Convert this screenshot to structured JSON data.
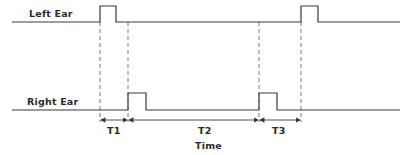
{
  "diagram": {
    "type": "timing-diagram",
    "signals": [
      {
        "name": "Left Ear",
        "baseline_y": 22,
        "pulse_top_y": 6,
        "pulses": [
          {
            "x0": 100,
            "x1": 116
          },
          {
            "x0": 301,
            "x1": 318
          }
        ]
      },
      {
        "name": "Right Ear",
        "baseline_y": 110,
        "pulse_top_y": 93,
        "pulses": [
          {
            "x0": 128,
            "x1": 146
          },
          {
            "x0": 259,
            "x1": 277
          }
        ]
      }
    ],
    "intervals": [
      {
        "label": "T1",
        "from": "left pulse 1 onset",
        "to": "right pulse 1 onset"
      },
      {
        "label": "T2",
        "from": "right pulse 1 onset",
        "to": "right pulse 2 onset"
      },
      {
        "label": "T3",
        "from": "right pulse 2 onset",
        "to": "left pulse 2 onset"
      }
    ],
    "x_axis_label": "Time",
    "line_color": "#3a3a3a"
  },
  "labels": {
    "left_ear": "Left Ear",
    "right_ear": "Right Ear",
    "t1": "T1",
    "t2": "T2",
    "t3": "T3",
    "time": "Time"
  }
}
